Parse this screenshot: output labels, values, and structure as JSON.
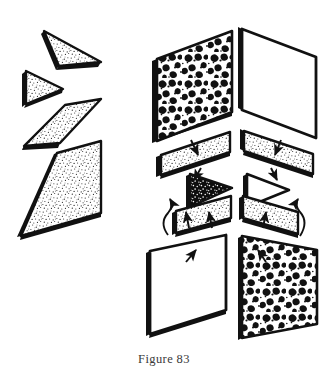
{
  "figure": {
    "caption": "Figure 83",
    "type": "exploded-isometric-diagram",
    "background_color": "#ffffff",
    "ink_color": "#1a1a1a",
    "groups": [
      {
        "name": "left-stack",
        "description": "Four detached stippled slab pieces stacked vertically",
        "pieces": [
          {
            "name": "left-wedge-top",
            "shape": "thin-wedge-triangle",
            "fill": "stipple-fine",
            "label": ""
          },
          {
            "name": "left-triangle",
            "shape": "triangle-right",
            "fill": "stipple-fine",
            "label": ""
          },
          {
            "name": "left-strip",
            "shape": "parallelogram-strip",
            "fill": "stipple-fine",
            "label": ""
          },
          {
            "name": "left-large-panel",
            "shape": "parallelogram-large",
            "fill": "stipple-fine",
            "label": ""
          }
        ]
      },
      {
        "name": "right-assembly",
        "description": "Exploded cube-corner assembly of textured panels joined by arrows",
        "pieces": [
          {
            "name": "panel-rear-left-mottled",
            "shape": "parallelogram-large",
            "fill": "blob-coarse",
            "label": ""
          },
          {
            "name": "panel-rear-right-blank",
            "shape": "parallelogram-large",
            "fill": "blank",
            "label": ""
          },
          {
            "name": "strip-left-upper",
            "shape": "parallelogram-strip",
            "fill": "stipple-fine",
            "label": ""
          },
          {
            "name": "strip-right-upper",
            "shape": "parallelogram-strip",
            "fill": "stipple-fine",
            "label": ""
          },
          {
            "name": "triangle-dark",
            "shape": "triangle-right",
            "fill": "dark-speckled",
            "label": ""
          },
          {
            "name": "triangle-outline",
            "shape": "triangle-right",
            "fill": "blank",
            "label": ""
          },
          {
            "name": "strip-left-lower",
            "shape": "parallelogram-strip",
            "fill": "stipple-fine",
            "label": ""
          },
          {
            "name": "strip-right-lower",
            "shape": "parallelogram-strip",
            "fill": "stipple-fine",
            "label": ""
          },
          {
            "name": "panel-front-left-blank",
            "shape": "parallelogram-large",
            "fill": "blank",
            "label": ""
          },
          {
            "name": "panel-front-right-blob",
            "shape": "parallelogram-large",
            "fill": "blob-coarse",
            "label": ""
          }
        ],
        "arrows": [
          {
            "name": "arrow-down-left-upper",
            "style": "straight",
            "direction": "down"
          },
          {
            "name": "arrow-down-right-upper",
            "style": "straight",
            "direction": "down"
          },
          {
            "name": "arrow-down-left-mid",
            "style": "straight",
            "direction": "down"
          },
          {
            "name": "arrow-down-right-mid",
            "style": "straight",
            "direction": "down"
          },
          {
            "name": "arrow-up-left-curved",
            "style": "curved",
            "direction": "up"
          },
          {
            "name": "arrow-up-left-inner",
            "style": "straight",
            "direction": "up"
          },
          {
            "name": "arrow-up-center",
            "style": "straight",
            "direction": "up"
          },
          {
            "name": "arrow-up-right-inner",
            "style": "straight",
            "direction": "up"
          },
          {
            "name": "arrow-up-right-curved",
            "style": "curved",
            "direction": "up"
          },
          {
            "name": "arrow-up-bottom-left",
            "style": "straight",
            "direction": "up"
          },
          {
            "name": "arrow-up-bottom-right",
            "style": "straight",
            "direction": "up"
          }
        ]
      }
    ]
  }
}
